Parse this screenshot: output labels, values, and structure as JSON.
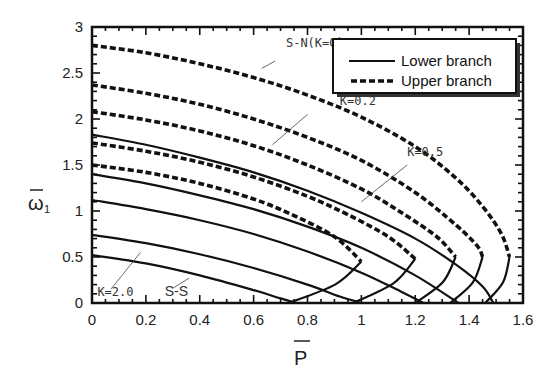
{
  "chart_data": {
    "type": "line",
    "title": "",
    "xlabel": "P̄",
    "ylabel": "ω̄₁",
    "xlim": [
      0,
      1.6
    ],
    "ylim": [
      0,
      3
    ],
    "x_ticks": [
      "0",
      "0.2",
      "0.4",
      "0.6",
      "0.8",
      "1",
      "1.2",
      "1.4",
      "1.6"
    ],
    "y_ticks": [
      "0",
      "0.5",
      "1",
      "1.5",
      "2",
      "2.5",
      "3"
    ],
    "grid": false,
    "legend": {
      "position": "upper right",
      "entries": [
        {
          "label": "Lower branch",
          "style": "solid"
        },
        {
          "label": "Upper branch",
          "style": "dashed"
        }
      ]
    },
    "annotations": [
      {
        "text": "S-N(K=0)",
        "x": 0.72,
        "y": 2.78
      },
      {
        "text": "K=0.2",
        "x": 0.92,
        "y": 2.15
      },
      {
        "text": "K=0.5",
        "x": 1.17,
        "y": 1.6
      },
      {
        "text": "K=2.0",
        "x": 0.02,
        "y": 0.08
      },
      {
        "text": "S-S",
        "x": 0.27,
        "y": 0.08
      }
    ],
    "series": [
      {
        "name": "Curve 1 (S-N, K=0)",
        "upper_start": 2.8,
        "lower_start": 1.83,
        "fold_P": 1.55,
        "fold_omega": 0.5,
        "lower_end_P": 1.49,
        "upper_branch": [
          [
            0,
            2.8
          ],
          [
            0.2,
            2.72
          ],
          [
            0.4,
            2.6
          ],
          [
            0.6,
            2.45
          ],
          [
            0.8,
            2.26
          ],
          [
            1.0,
            2.02
          ],
          [
            1.2,
            1.7
          ],
          [
            1.35,
            1.36
          ],
          [
            1.45,
            1.05
          ],
          [
            1.52,
            0.75
          ],
          [
            1.55,
            0.5
          ]
        ],
        "lower_branch": [
          [
            0,
            1.83
          ],
          [
            0.2,
            1.72
          ],
          [
            0.4,
            1.58
          ],
          [
            0.6,
            1.42
          ],
          [
            0.8,
            1.22
          ],
          [
            1.0,
            0.98
          ],
          [
            1.2,
            0.7
          ],
          [
            1.35,
            0.42
          ],
          [
            1.45,
            0.18
          ],
          [
            1.49,
            0.0
          ]
        ]
      },
      {
        "name": "Curve 2 (K=0.2)",
        "upper_start": 2.37,
        "lower_start": 1.4,
        "fold_P": 1.45,
        "fold_omega": 0.5,
        "lower_end_P": 1.36,
        "upper_branch": [
          [
            0,
            2.37
          ],
          [
            0.2,
            2.28
          ],
          [
            0.4,
            2.16
          ],
          [
            0.6,
            2.0
          ],
          [
            0.8,
            1.8
          ],
          [
            1.0,
            1.55
          ],
          [
            1.2,
            1.2
          ],
          [
            1.35,
            0.85
          ],
          [
            1.43,
            0.62
          ],
          [
            1.45,
            0.5
          ]
        ],
        "lower_branch": [
          [
            0,
            1.4
          ],
          [
            0.2,
            1.3
          ],
          [
            0.4,
            1.17
          ],
          [
            0.6,
            1.02
          ],
          [
            0.8,
            0.83
          ],
          [
            1.0,
            0.6
          ],
          [
            1.2,
            0.3
          ],
          [
            1.36,
            0.0
          ]
        ]
      },
      {
        "name": "Curve 3 (K=0.5)",
        "upper_start": 2.08,
        "lower_start": 1.12,
        "fold_P": 1.35,
        "fold_omega": 0.5,
        "lower_end_P": 1.23,
        "upper_branch": [
          [
            0,
            2.08
          ],
          [
            0.2,
            1.99
          ],
          [
            0.4,
            1.87
          ],
          [
            0.6,
            1.71
          ],
          [
            0.8,
            1.5
          ],
          [
            1.0,
            1.24
          ],
          [
            1.15,
            0.98
          ],
          [
            1.28,
            0.72
          ],
          [
            1.35,
            0.5
          ]
        ],
        "lower_branch": [
          [
            0,
            1.12
          ],
          [
            0.2,
            1.02
          ],
          [
            0.4,
            0.9
          ],
          [
            0.6,
            0.75
          ],
          [
            0.8,
            0.56
          ],
          [
            1.0,
            0.33
          ],
          [
            1.15,
            0.12
          ],
          [
            1.23,
            0.0
          ]
        ]
      },
      {
        "name": "Curve 4",
        "upper_start": 1.74,
        "lower_start": 0.74,
        "fold_P": 1.2,
        "fold_omega": 0.48,
        "lower_end_P": 1.0,
        "upper_branch": [
          [
            0,
            1.74
          ],
          [
            0.2,
            1.65
          ],
          [
            0.4,
            1.53
          ],
          [
            0.6,
            1.37
          ],
          [
            0.8,
            1.16
          ],
          [
            0.95,
            0.96
          ],
          [
            1.1,
            0.72
          ],
          [
            1.2,
            0.48
          ]
        ],
        "lower_branch": [
          [
            0,
            0.74
          ],
          [
            0.2,
            0.65
          ],
          [
            0.4,
            0.53
          ],
          [
            0.6,
            0.38
          ],
          [
            0.8,
            0.2
          ],
          [
            0.92,
            0.07
          ],
          [
            1.0,
            0.0
          ]
        ]
      },
      {
        "name": "Curve 5 (S-S, K=2.0)",
        "upper_start": 1.5,
        "lower_start": 0.52,
        "fold_P": 1.0,
        "fold_omega": 0.45,
        "lower_end_P": 0.76,
        "upper_branch": [
          [
            0,
            1.5
          ],
          [
            0.2,
            1.42
          ],
          [
            0.4,
            1.3
          ],
          [
            0.6,
            1.13
          ],
          [
            0.75,
            0.95
          ],
          [
            0.9,
            0.72
          ],
          [
            1.0,
            0.45
          ]
        ],
        "lower_branch": [
          [
            0,
            0.52
          ],
          [
            0.2,
            0.43
          ],
          [
            0.4,
            0.3
          ],
          [
            0.6,
            0.14
          ],
          [
            0.7,
            0.05
          ],
          [
            0.76,
            0.0
          ]
        ]
      }
    ]
  }
}
